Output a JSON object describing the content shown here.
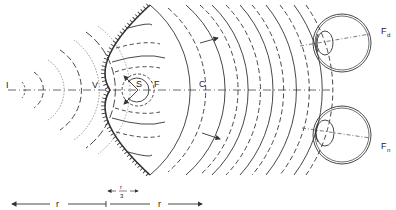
{
  "diagram": {
    "points": {
      "image_point": "I",
      "vertex": "V",
      "center_sphere": "S",
      "focus": "F",
      "center_curvature": "C",
      "focus_distant_eye": "F",
      "focus_distant_sub": "d",
      "focus_near_eye": "F",
      "focus_near_sub": "n"
    },
    "scale": {
      "left_label": "r",
      "middle_numerator": "r",
      "middle_denominator": "3",
      "right_label": "r"
    },
    "colors": {
      "ink": "#333333",
      "background": "#ffffff"
    }
  }
}
